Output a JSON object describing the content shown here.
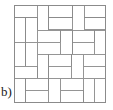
{
  "figure": {
    "label": "b)",
    "caption_position": "bottom-left",
    "colors": {
      "stroke": "#8a8a8a",
      "border_stroke": "#8a8a8a",
      "fill": "#ffffff",
      "label_color": "#1a1a1a",
      "background": "#ffffff"
    },
    "stroke_width": 0.9,
    "square": {
      "x": 14.5,
      "y": 5.5,
      "width": 91,
      "height": 97
    },
    "tiles": [
      {
        "name": "tile-01",
        "x": 14.5,
        "y": 5.5,
        "w": 22.5,
        "h": 12.0
      },
      {
        "name": "tile-02",
        "x": 37.0,
        "y": 5.5,
        "w": 11.5,
        "h": 24.5
      },
      {
        "name": "tile-03",
        "x": 48.5,
        "y": 5.5,
        "w": 24.0,
        "h": 12.0
      },
      {
        "name": "tile-04",
        "x": 72.5,
        "y": 5.5,
        "w": 11.5,
        "h": 24.5
      },
      {
        "name": "tile-05",
        "x": 84.0,
        "y": 5.5,
        "w": 21.5,
        "h": 12.0
      },
      {
        "name": "tile-06",
        "x": 14.5,
        "y": 17.5,
        "w": 11.0,
        "h": 24.5
      },
      {
        "name": "tile-07",
        "x": 25.5,
        "y": 17.5,
        "w": 11.5,
        "h": 24.5
      },
      {
        "name": "tile-08",
        "x": 48.5,
        "y": 17.5,
        "w": 24.0,
        "h": 12.0
      },
      {
        "name": "tile-09",
        "x": 84.0,
        "y": 17.5,
        "w": 21.5,
        "h": 12.0
      },
      {
        "name": "tile-10",
        "x": 37.0,
        "y": 30.0,
        "w": 23.5,
        "h": 12.0
      },
      {
        "name": "tile-11",
        "x": 60.5,
        "y": 30.0,
        "w": 12.0,
        "h": 24.0
      },
      {
        "name": "tile-12",
        "x": 72.5,
        "y": 30.0,
        "w": 22.0,
        "h": 12.0
      },
      {
        "name": "tile-13",
        "x": 94.5,
        "y": 30.0,
        "w": 11.0,
        "h": 24.0
      },
      {
        "name": "tile-14",
        "x": 14.5,
        "y": 42.0,
        "w": 11.0,
        "h": 24.0
      },
      {
        "name": "tile-15",
        "x": 25.5,
        "y": 42.0,
        "w": 11.5,
        "h": 24.0
      },
      {
        "name": "tile-16",
        "x": 37.0,
        "y": 42.0,
        "w": 23.5,
        "h": 12.0
      },
      {
        "name": "tile-17",
        "x": 72.5,
        "y": 42.0,
        "w": 22.0,
        "h": 12.0
      },
      {
        "name": "tile-18",
        "x": 37.0,
        "y": 54.0,
        "w": 11.5,
        "h": 24.0
      },
      {
        "name": "tile-19",
        "x": 48.5,
        "y": 54.0,
        "w": 23.0,
        "h": 12.0
      },
      {
        "name": "tile-20",
        "x": 71.5,
        "y": 54.0,
        "w": 11.5,
        "h": 24.0
      },
      {
        "name": "tile-21",
        "x": 83.0,
        "y": 54.0,
        "w": 22.5,
        "h": 12.0
      },
      {
        "name": "tile-22",
        "x": 14.5,
        "y": 66.0,
        "w": 22.5,
        "h": 12.0
      },
      {
        "name": "tile-23",
        "x": 48.5,
        "y": 66.0,
        "w": 23.0,
        "h": 12.0
      },
      {
        "name": "tile-24",
        "x": 83.0,
        "y": 66.0,
        "w": 22.5,
        "h": 12.0
      },
      {
        "name": "tile-25",
        "x": 14.5,
        "y": 78.0,
        "w": 11.0,
        "h": 24.0
      },
      {
        "name": "tile-26",
        "x": 25.5,
        "y": 78.0,
        "w": 22.5,
        "h": 12.0
      },
      {
        "name": "tile-27",
        "x": 48.5,
        "y": 78.0,
        "w": 11.5,
        "h": 24.0
      },
      {
        "name": "tile-28",
        "x": 60.0,
        "y": 78.0,
        "w": 23.0,
        "h": 12.0
      },
      {
        "name": "tile-29",
        "x": 83.0,
        "y": 78.0,
        "w": 11.0,
        "h": 24.0
      },
      {
        "name": "tile-30",
        "x": 94.0,
        "y": 78.0,
        "w": 11.5,
        "h": 24.0
      },
      {
        "name": "tile-31",
        "x": 25.5,
        "y": 90.0,
        "w": 23.0,
        "h": 12.0
      },
      {
        "name": "tile-32",
        "x": 60.0,
        "y": 90.0,
        "w": 23.0,
        "h": 12.0
      }
    ]
  }
}
